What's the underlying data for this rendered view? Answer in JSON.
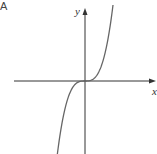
{
  "panel_label": "A",
  "axes": {
    "x_label": "x",
    "y_label": "y"
  },
  "chart_data": {
    "type": "line",
    "title": "",
    "panel": "A",
    "xlabel": "x",
    "ylabel": "y",
    "grid": false,
    "legend": null,
    "series": [
      {
        "name": "f(x)",
        "function": "x^3",
        "x": [
          -1.0,
          -0.8,
          -0.6,
          -0.4,
          -0.2,
          0,
          0.2,
          0.4,
          0.6,
          0.8,
          1.0
        ],
        "values": [
          -1.0,
          -0.512,
          -0.216,
          -0.064,
          -0.008,
          0,
          0.008,
          0.064,
          0.216,
          0.512,
          1.0
        ]
      }
    ],
    "colors": {
      "axis": "#333333",
      "curve": "#666666"
    }
  }
}
